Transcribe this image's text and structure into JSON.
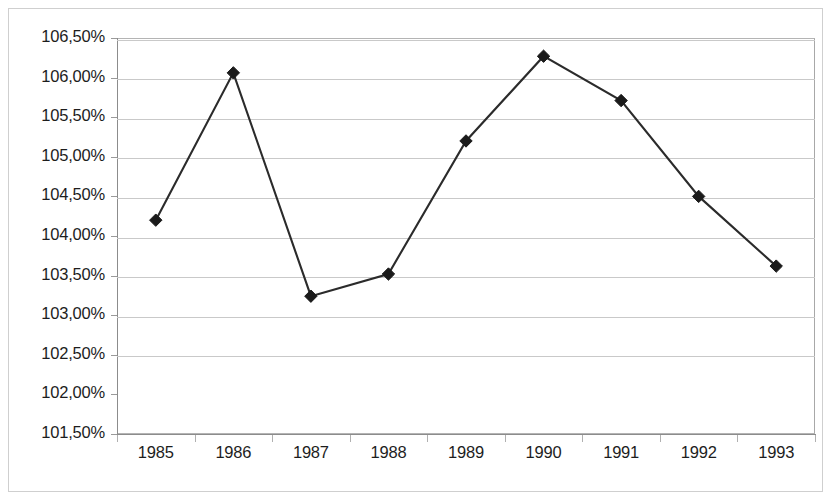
{
  "chart_data": {
    "type": "line",
    "title": "",
    "subtitle": "",
    "xlabel": "",
    "ylabel": "",
    "categories": [
      "1985",
      "1986",
      "1987",
      "1988",
      "1989",
      "1990",
      "1991",
      "1992",
      "1993"
    ],
    "series": [
      {
        "name": "",
        "values": [
          104.2,
          106.06,
          103.24,
          103.52,
          105.2,
          106.27,
          105.71,
          104.5,
          103.62
        ]
      }
    ],
    "value_suffix": "%",
    "decimal_separator": ",",
    "ylim": [
      101.5,
      106.5
    ],
    "ytick_step": 0.5,
    "ytick_labels": [
      "106,50%",
      "106,00%",
      "105,50%",
      "105,00%",
      "104,50%",
      "104,00%",
      "103,50%",
      "103,00%",
      "102,50%",
      "102,00%",
      "101,50%"
    ],
    "ytick_values": [
      106.5,
      106.0,
      105.5,
      105.0,
      104.5,
      104.0,
      103.5,
      103.0,
      102.5,
      102.0,
      101.5
    ],
    "grid": "horizontal",
    "legend": "none",
    "marker": "diamond",
    "marker_color": "#1a1a1a",
    "line_color": "#2b2b2b",
    "gridline_color": "#c9c9c9",
    "axis_color": "#8c8c8c",
    "plot_background": "#ffffff",
    "border_color": "#cfcfcf"
  }
}
